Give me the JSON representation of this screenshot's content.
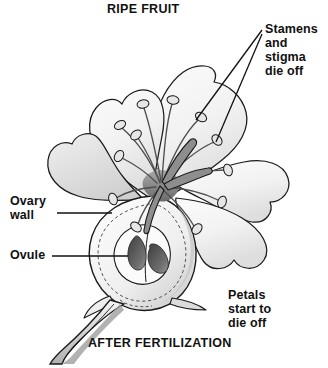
{
  "figure": {
    "title": "RIPE FRUIT",
    "caption": "AFTER FERTILIZATION",
    "background_color": "#ffffff",
    "ink_color": "#111111"
  },
  "labels": {
    "stamens": "Stamens\nand\nstigma\ndie off",
    "petals": "Petals\nstart to\ndie off",
    "ovary_wall": "Ovary\nwall",
    "ovule": "Ovule"
  },
  "palette": {
    "outline": "#1a1a1a",
    "petal_fill": "#f4f4f4",
    "petal_shade": "#d8d8d8",
    "ovary_fill": "#f0f0f0",
    "ovary_shade": "#cfcfcf",
    "ovule_dark": "#4a4a4a",
    "ovule_mid": "#7a7a7a",
    "stamen_fill": "#9a9a9a",
    "anther_fill": "#e2e2e2",
    "stalk_shade": "#b5b5b5",
    "dashed_guide": "#555555"
  },
  "parts": [
    {
      "name": "ripe-fruit-ovary",
      "label_ref": "ovary_wall"
    },
    {
      "name": "ovules",
      "count": 2,
      "label_ref": "ovule"
    },
    {
      "name": "stamens",
      "label_ref": "stamens"
    },
    {
      "name": "petals",
      "count": 5,
      "label_ref": "petals"
    },
    {
      "name": "pedicel-stalk"
    }
  ]
}
